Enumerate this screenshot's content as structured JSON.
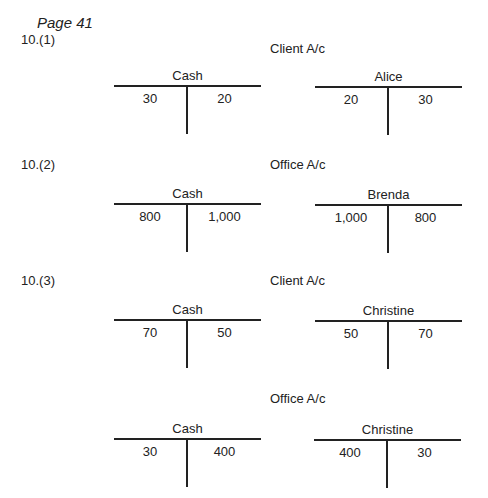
{
  "page_label": "Page 41",
  "questions": [
    {
      "label": "10.(1)",
      "sections": [
        {
          "title": "Client A/c",
          "accounts": [
            {
              "name": "Cash",
              "debit": "30",
              "credit": "20"
            },
            {
              "name": "Alice",
              "debit": "20",
              "credit": "30"
            }
          ]
        }
      ]
    },
    {
      "label": "10.(2)",
      "sections": [
        {
          "title": "Office A/c",
          "accounts": [
            {
              "name": "Cash",
              "debit": "800",
              "credit": "1,000"
            },
            {
              "name": "Brenda",
              "debit": "1,000",
              "credit": "800"
            }
          ]
        }
      ]
    },
    {
      "label": "10.(3)",
      "sections": [
        {
          "title": "Client A/c",
          "accounts": [
            {
              "name": "Cash",
              "debit": "70",
              "credit": "50"
            },
            {
              "name": "Christine",
              "debit": "50",
              "credit": "70"
            }
          ]
        },
        {
          "title": "Office A/c",
          "accounts": [
            {
              "name": "Cash",
              "debit": "30",
              "credit": "400"
            },
            {
              "name": "Christine",
              "debit": "400",
              "credit": "30"
            }
          ]
        }
      ]
    }
  ]
}
